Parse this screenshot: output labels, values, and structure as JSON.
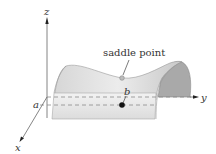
{
  "diagram": {
    "axes": {
      "z_label": "z",
      "y_label": "y",
      "x_label": "x"
    },
    "annotations": {
      "saddle_point_label": "saddle point",
      "a_label": "a",
      "b_label": "b"
    },
    "colors": {
      "surface_light": "#e6e6e6",
      "surface_mid": "#cfcfcf",
      "surface_dark": "#a9a9a9",
      "axis": "#555555",
      "dash": "#8a8a8a",
      "point": "#111111"
    }
  }
}
